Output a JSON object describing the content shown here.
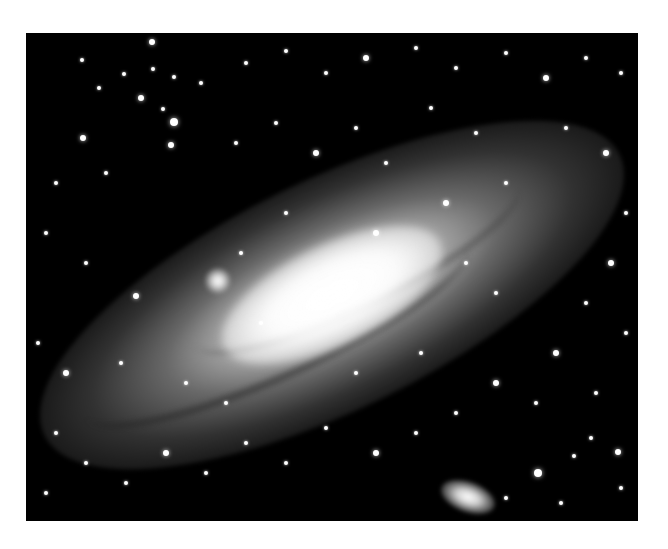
{
  "image": {
    "subject": "Andromeda galaxy (spiral galaxy) with two companion galaxies",
    "style": "grayscale astrophotograph",
    "background_color": "#ffffff",
    "frame_color": "#000000",
    "frame": {
      "x": 26,
      "y": 33,
      "width": 612,
      "height": 488
    }
  },
  "galaxy": {
    "center": [
      306,
      262
    ],
    "angle_deg": -26,
    "core_color": "#ffffff",
    "disk_color": "#a0a0a0"
  },
  "companions": [
    {
      "name": "upper-companion",
      "x": 179,
      "y": 235,
      "w": 26,
      "h": 26,
      "angle": 0
    },
    {
      "name": "lower-companion",
      "x": 414,
      "y": 449,
      "w": 56,
      "h": 30,
      "angle": 20
    }
  ],
  "stars": [
    {
      "x": 126,
      "y": 9,
      "r": 3
    },
    {
      "x": 56,
      "y": 27,
      "r": 2
    },
    {
      "x": 98,
      "y": 41,
      "r": 2
    },
    {
      "x": 127,
      "y": 36,
      "r": 2
    },
    {
      "x": 148,
      "y": 44,
      "r": 2
    },
    {
      "x": 115,
      "y": 65,
      "r": 3
    },
    {
      "x": 73,
      "y": 55,
      "r": 2
    },
    {
      "x": 137,
      "y": 76,
      "r": 2
    },
    {
      "x": 148,
      "y": 89,
      "r": 4
    },
    {
      "x": 57,
      "y": 105,
      "r": 3
    },
    {
      "x": 145,
      "y": 112,
      "r": 3
    },
    {
      "x": 175,
      "y": 50,
      "r": 2
    },
    {
      "x": 220,
      "y": 30,
      "r": 2
    },
    {
      "x": 260,
      "y": 18,
      "r": 2
    },
    {
      "x": 300,
      "y": 40,
      "r": 2
    },
    {
      "x": 340,
      "y": 25,
      "r": 3
    },
    {
      "x": 390,
      "y": 15,
      "r": 2
    },
    {
      "x": 430,
      "y": 35,
      "r": 2
    },
    {
      "x": 480,
      "y": 20,
      "r": 2
    },
    {
      "x": 520,
      "y": 45,
      "r": 3
    },
    {
      "x": 560,
      "y": 25,
      "r": 2
    },
    {
      "x": 595,
      "y": 40,
      "r": 2
    },
    {
      "x": 30,
      "y": 150,
      "r": 2
    },
    {
      "x": 80,
      "y": 140,
      "r": 2
    },
    {
      "x": 20,
      "y": 200,
      "r": 2
    },
    {
      "x": 110,
      "y": 263,
      "r": 3
    },
    {
      "x": 60,
      "y": 230,
      "r": 2
    },
    {
      "x": 210,
      "y": 110,
      "r": 2
    },
    {
      "x": 250,
      "y": 90,
      "r": 2
    },
    {
      "x": 290,
      "y": 120,
      "r": 3
    },
    {
      "x": 330,
      "y": 95,
      "r": 2
    },
    {
      "x": 360,
      "y": 130,
      "r": 2
    },
    {
      "x": 405,
      "y": 75,
      "r": 2
    },
    {
      "x": 450,
      "y": 100,
      "r": 2
    },
    {
      "x": 540,
      "y": 95,
      "r": 2
    },
    {
      "x": 580,
      "y": 120,
      "r": 3
    },
    {
      "x": 600,
      "y": 180,
      "r": 2
    },
    {
      "x": 585,
      "y": 230,
      "r": 3
    },
    {
      "x": 560,
      "y": 270,
      "r": 2
    },
    {
      "x": 600,
      "y": 300,
      "r": 2
    },
    {
      "x": 530,
      "y": 320,
      "r": 3
    },
    {
      "x": 570,
      "y": 360,
      "r": 2
    },
    {
      "x": 510,
      "y": 370,
      "r": 2
    },
    {
      "x": 470,
      "y": 350,
      "r": 3
    },
    {
      "x": 430,
      "y": 380,
      "r": 2
    },
    {
      "x": 390,
      "y": 400,
      "r": 2
    },
    {
      "x": 350,
      "y": 420,
      "r": 3
    },
    {
      "x": 300,
      "y": 395,
      "r": 2
    },
    {
      "x": 260,
      "y": 430,
      "r": 2
    },
    {
      "x": 220,
      "y": 410,
      "r": 2
    },
    {
      "x": 180,
      "y": 440,
      "r": 2
    },
    {
      "x": 140,
      "y": 420,
      "r": 3
    },
    {
      "x": 100,
      "y": 450,
      "r": 2
    },
    {
      "x": 60,
      "y": 430,
      "r": 2
    },
    {
      "x": 30,
      "y": 400,
      "r": 2
    },
    {
      "x": 20,
      "y": 460,
      "r": 2
    },
    {
      "x": 512,
      "y": 440,
      "r": 4
    },
    {
      "x": 548,
      "y": 423,
      "r": 2
    },
    {
      "x": 592,
      "y": 419,
      "r": 3
    },
    {
      "x": 565,
      "y": 405,
      "r": 2
    },
    {
      "x": 595,
      "y": 455,
      "r": 2
    },
    {
      "x": 480,
      "y": 465,
      "r": 2
    },
    {
      "x": 535,
      "y": 470,
      "r": 2
    },
    {
      "x": 12,
      "y": 310,
      "r": 2
    },
    {
      "x": 40,
      "y": 340,
      "r": 3
    },
    {
      "x": 350,
      "y": 200,
      "r": 3
    },
    {
      "x": 260,
      "y": 180,
      "r": 2
    },
    {
      "x": 420,
      "y": 170,
      "r": 3
    },
    {
      "x": 480,
      "y": 150,
      "r": 2
    },
    {
      "x": 215,
      "y": 220,
      "r": 2
    },
    {
      "x": 235,
      "y": 290,
      "r": 2
    },
    {
      "x": 470,
      "y": 260,
      "r": 2
    },
    {
      "x": 440,
      "y": 230,
      "r": 2
    },
    {
      "x": 395,
      "y": 320,
      "r": 2
    },
    {
      "x": 330,
      "y": 340,
      "r": 2
    },
    {
      "x": 95,
      "y": 330,
      "r": 2
    },
    {
      "x": 160,
      "y": 350,
      "r": 2
    },
    {
      "x": 200,
      "y": 370,
      "r": 2
    }
  ]
}
